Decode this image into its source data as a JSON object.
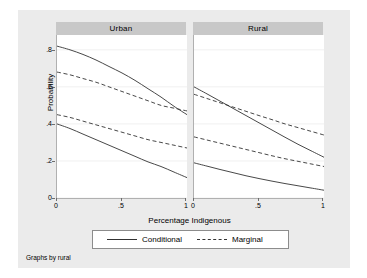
{
  "chart_data": {
    "type": "line",
    "title": "",
    "xlabel": "Percentage Indigenous",
    "ylabel": "Probability",
    "xlim": [
      0,
      1
    ],
    "ylim": [
      0,
      0.88
    ],
    "xticks": [
      "0",
      ".5",
      "1"
    ],
    "xtick_values": [
      0,
      0.5,
      1
    ],
    "yticks": [
      "0",
      ".2",
      ".4",
      ".6",
      ".8"
    ],
    "ytick_values": [
      0,
      0.2,
      0.4,
      0.6,
      0.8
    ],
    "grid": "horizontal",
    "legend_position": "bottom",
    "facet_by": "rural",
    "facet_note": "Graphs by rural",
    "panels": [
      {
        "label": "Urban",
        "series": [
          {
            "name": "Conditional",
            "style": "solid",
            "group": "upper",
            "x": [
              0,
              0.1,
              0.2,
              0.3,
              0.4,
              0.5,
              0.6,
              0.7,
              0.8,
              0.9,
              1
            ],
            "values": [
              0.82,
              0.8,
              0.775,
              0.745,
              0.71,
              0.675,
              0.635,
              0.59,
              0.545,
              0.495,
              0.45
            ]
          },
          {
            "name": "Marginal",
            "style": "dashed",
            "group": "upper",
            "x": [
              0,
              0.1,
              0.2,
              0.3,
              0.4,
              0.5,
              0.6,
              0.7,
              0.8,
              0.9,
              1
            ],
            "values": [
              0.68,
              0.665,
              0.645,
              0.625,
              0.6,
              0.575,
              0.55,
              0.525,
              0.5,
              0.485,
              0.47
            ]
          },
          {
            "name": "Marginal",
            "style": "dashed",
            "group": "lower",
            "x": [
              0,
              0.1,
              0.2,
              0.3,
              0.4,
              0.5,
              0.6,
              0.7,
              0.8,
              0.9,
              1
            ],
            "values": [
              0.45,
              0.435,
              0.415,
              0.395,
              0.375,
              0.355,
              0.335,
              0.315,
              0.3,
              0.285,
              0.27
            ]
          },
          {
            "name": "Conditional",
            "style": "solid",
            "group": "lower",
            "x": [
              0,
              0.1,
              0.2,
              0.3,
              0.4,
              0.5,
              0.6,
              0.7,
              0.8,
              0.9,
              1
            ],
            "values": [
              0.4,
              0.375,
              0.345,
              0.315,
              0.285,
              0.255,
              0.225,
              0.195,
              0.17,
              0.14,
              0.11
            ]
          }
        ]
      },
      {
        "label": "Rural",
        "series": [
          {
            "name": "Conditional",
            "style": "solid",
            "group": "upper",
            "x": [
              0,
              0.1,
              0.2,
              0.3,
              0.4,
              0.5,
              0.6,
              0.7,
              0.8,
              0.9,
              1
            ],
            "values": [
              0.6,
              0.562,
              0.523,
              0.484,
              0.445,
              0.406,
              0.367,
              0.328,
              0.29,
              0.255,
              0.22
            ]
          },
          {
            "name": "Marginal",
            "style": "dashed",
            "group": "upper",
            "x": [
              0,
              0.1,
              0.2,
              0.3,
              0.4,
              0.5,
              0.6,
              0.7,
              0.8,
              0.9,
              1
            ],
            "values": [
              0.56,
              0.537,
              0.514,
              0.491,
              0.468,
              0.445,
              0.423,
              0.4,
              0.38,
              0.36,
              0.34
            ]
          },
          {
            "name": "Marginal",
            "style": "dashed",
            "group": "lower",
            "x": [
              0,
              0.1,
              0.2,
              0.3,
              0.4,
              0.5,
              0.6,
              0.7,
              0.8,
              0.9,
              1
            ],
            "values": [
              0.33,
              0.313,
              0.296,
              0.279,
              0.262,
              0.245,
              0.228,
              0.212,
              0.198,
              0.184,
              0.17
            ]
          },
          {
            "name": "Conditional",
            "style": "solid",
            "group": "lower",
            "x": [
              0,
              0.1,
              0.2,
              0.3,
              0.4,
              0.5,
              0.6,
              0.7,
              0.8,
              0.9,
              1
            ],
            "values": [
              0.19,
              0.172,
              0.154,
              0.137,
              0.12,
              0.105,
              0.091,
              0.078,
              0.066,
              0.054,
              0.042
            ]
          }
        ]
      }
    ],
    "legend": [
      {
        "label": "Conditional",
        "style": "solid"
      },
      {
        "label": "Marginal",
        "style": "dashed"
      }
    ]
  },
  "colors": {
    "figure_background": "#ebebeb",
    "plot_background": "#ffffff",
    "panel_header": "#c8c8c8",
    "line": "#333333",
    "gridline": "#f0f0f0",
    "axis": "#b0b0b0"
  }
}
